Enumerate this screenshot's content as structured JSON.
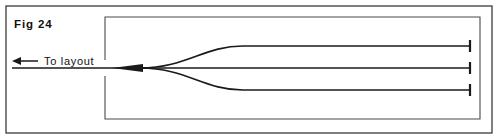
{
  "figure": {
    "caption": "Fig 24",
    "direction_label": "To layout",
    "background_color": "#ffffff",
    "line_color": "#1a1a1a",
    "frame_color": "#3a3a3a"
  },
  "frame": {
    "outer": {
      "x": 6,
      "y": 6,
      "width": 486,
      "height": 127,
      "stroke_width": 1.3
    },
    "inner": {
      "x": 105,
      "y": 17,
      "width": 375,
      "height": 102,
      "stroke_width": 1.1
    }
  },
  "arrow": {
    "name": "to-layout-arrow",
    "direction": "left",
    "tip_x": 12,
    "tail_x": 38,
    "y": 61,
    "head_length": 9,
    "head_half_height": 4
  },
  "tracks": {
    "approach": {
      "label": "main approach track",
      "x_start": 12,
      "x_end": 140,
      "y": 68
    },
    "fan_apex_x": 140,
    "fan_end_x": 243,
    "buffer_x": 470,
    "branches": [
      {
        "name": "upper-branch",
        "y": 46,
        "curve": "up"
      },
      {
        "name": "middle-branch",
        "y": 68,
        "curve": "straight"
      },
      {
        "name": "lower-branch",
        "y": 90,
        "curve": "down"
      }
    ],
    "wedge": {
      "x_start": 112,
      "x_end": 143,
      "half_height": 4
    }
  },
  "buffer_stops": [
    {
      "name": "buffer-stop-upper",
      "x": 470,
      "y": 46,
      "half_height": 6
    },
    {
      "name": "buffer-stop-middle",
      "x": 470,
      "y": 68,
      "half_height": 6
    },
    {
      "name": "buffer-stop-lower",
      "x": 470,
      "y": 90,
      "half_height": 6
    }
  ],
  "text_positions": {
    "caption": {
      "x": 14,
      "y": 28
    },
    "direction_label": {
      "x": 44,
      "y": 65
    }
  }
}
